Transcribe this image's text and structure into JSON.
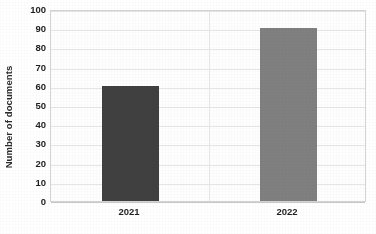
{
  "chart_data": {
    "type": "bar",
    "title": "",
    "xlabel": "",
    "ylabel": "Number of documents",
    "categories": [
      "2021",
      "2022"
    ],
    "values": [
      60,
      90
    ],
    "series": [
      {
        "name": "Number of documents",
        "values": [
          60,
          90
        ]
      }
    ],
    "ylim": [
      0,
      100
    ],
    "ytick_step": 10,
    "yticks": [
      "100",
      "90",
      "80",
      "70",
      "60",
      "50",
      "40",
      "30",
      "20",
      "10",
      "0"
    ],
    "ytick_values": [
      100,
      90,
      80,
      70,
      60,
      50,
      40,
      30,
      20,
      10,
      0
    ],
    "bar_colors": [
      "#404040",
      "#808080"
    ],
    "grid": {
      "horizontal": true,
      "vertical": true
    },
    "legend": {
      "visible": false,
      "position": "none"
    },
    "plot_background": "#fefefe",
    "grid_color": "#e6e6e6",
    "axis_color": "#c9c9c9"
  }
}
